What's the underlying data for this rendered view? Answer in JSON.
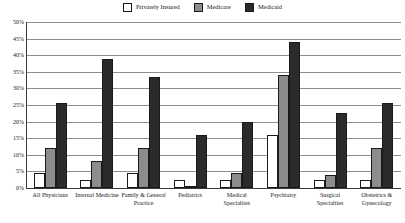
{
  "legend": {
    "items": [
      {
        "label": "Privately Insured",
        "color": "#ffffff",
        "key": "privately_insured"
      },
      {
        "label": "Medicare",
        "color": "#8c8c8c",
        "key": "medicare"
      },
      {
        "label": "Medicaid",
        "color": "#2b2b2b",
        "key": "medicaid"
      }
    ]
  },
  "chart_data": {
    "type": "bar",
    "title": "",
    "xlabel": "",
    "ylabel": "",
    "ylim": [
      0,
      50
    ],
    "ytick_labels": [
      "50%",
      "45%",
      "40%",
      "35%",
      "30%",
      "25%",
      "20%",
      "15%",
      "10%",
      "5%",
      "0%"
    ],
    "ytick_values": [
      50,
      45,
      40,
      35,
      30,
      25,
      20,
      15,
      10,
      5,
      0
    ],
    "grid": true,
    "legend_position": "top-center",
    "categories": [
      "All Physicians",
      "Internal Medicine",
      "Family & General Practice",
      "Pediatrics",
      "Medical Specialties",
      "Psychiatry",
      "Surgical Specialties",
      "Obstetrics & Gynecology"
    ],
    "series": [
      {
        "name": "Privately Insured",
        "color": "#ffffff",
        "values": [
          4.5,
          2.5,
          4.5,
          2.5,
          2.5,
          16,
          2.5,
          2.5
        ]
      },
      {
        "name": "Medicare",
        "color": "#8c8c8c",
        "values": [
          12,
          8,
          12,
          0.5,
          4.5,
          34,
          4,
          12
        ]
      },
      {
        "name": "Medicaid",
        "color": "#2b2b2b",
        "values": [
          25.5,
          39,
          33.5,
          16,
          20,
          44,
          22.5,
          25.5
        ]
      }
    ]
  },
  "colors": {
    "privately_insured": "#ffffff",
    "medicare": "#8c8c8c",
    "medicaid": "#2b2b2b",
    "axis": "#3a3a3a",
    "grid": "#8e8e8e",
    "text": "#1a1a1a"
  }
}
